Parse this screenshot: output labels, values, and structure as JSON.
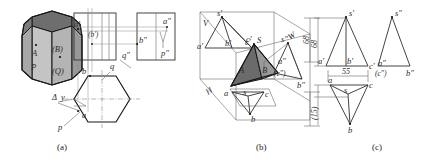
{
  "figure": {
    "captions": [
      {
        "id": "a",
        "text": "(a)"
      },
      {
        "id": "b",
        "text": "(b)"
      },
      {
        "id": "c",
        "text": "(c)"
      }
    ]
  },
  "part_a": {
    "solid_labels": [
      {
        "name": "point-a",
        "text": "A"
      },
      {
        "name": "point-b-hidden",
        "text": "(B)"
      },
      {
        "name": "plane-p",
        "text": "P"
      },
      {
        "name": "plane-q-hidden",
        "text": "(Q)"
      }
    ],
    "front_view_labels": [
      {
        "name": "a-prime",
        "text": "a'"
      },
      {
        "name": "b-prime-hidden",
        "text": "(b')"
      }
    ],
    "side_view_labels": [
      {
        "name": "b-double-prime",
        "text": "b\""
      },
      {
        "name": "a-double-prime",
        "text": "a\""
      },
      {
        "name": "p-double-prime",
        "text": "p\""
      },
      {
        "name": "q-double-prime",
        "text": "q\""
      }
    ],
    "top_view_labels": [
      {
        "name": "b-top",
        "text": "b"
      },
      {
        "name": "q-top",
        "text": "q"
      },
      {
        "name": "a-top",
        "text": "a"
      },
      {
        "name": "p-top",
        "text": "p"
      },
      {
        "name": "delta-y",
        "text": "y"
      },
      {
        "name": "delta-symbol",
        "text": "Δ"
      }
    ]
  },
  "part_b": {
    "plane_labels": [
      {
        "name": "plane-v",
        "text": "V"
      },
      {
        "name": "plane-w",
        "text": "W"
      },
      {
        "name": "plane-h",
        "text": "H"
      }
    ],
    "front_view_labels": [
      {
        "name": "s-prime",
        "text": "s'"
      },
      {
        "name": "a-prime",
        "text": "a'"
      },
      {
        "name": "b-prime",
        "text": "b'"
      },
      {
        "name": "c-prime-front",
        "text": "c'"
      }
    ],
    "solid_labels": [
      {
        "name": "apex-s",
        "text": "S"
      },
      {
        "name": "face-a",
        "text": "A"
      },
      {
        "name": "face-b",
        "text": "B"
      },
      {
        "name": "vertex-c-prime",
        "text": "c'"
      }
    ],
    "side_view_labels": [
      {
        "name": "s-double-prime",
        "text": "s\""
      },
      {
        "name": "a-double-prime",
        "text": "a\""
      },
      {
        "name": "c-double-prime-hidden",
        "text": "(c\")"
      },
      {
        "name": "b-double-prime",
        "text": "b\""
      }
    ],
    "top_view_labels": [
      {
        "name": "s-top",
        "text": "s"
      },
      {
        "name": "a-top",
        "text": "a"
      },
      {
        "name": "b-top",
        "text": "b"
      },
      {
        "name": "c-top",
        "text": "c"
      }
    ],
    "dimensions": [
      {
        "name": "height-dimension",
        "text": "68"
      },
      {
        "name": "depth-dimension",
        "text": "(15)"
      }
    ]
  },
  "part_c": {
    "front_view_labels": [
      {
        "name": "s-prime",
        "text": "s'"
      },
      {
        "name": "a-prime",
        "text": "a'"
      },
      {
        "name": "b-prime",
        "text": "b'"
      },
      {
        "name": "c-prime",
        "text": "c'"
      }
    ],
    "side_view_labels": [
      {
        "name": "s-double-prime",
        "text": "s\""
      },
      {
        "name": "a-double-prime",
        "text": "a\""
      },
      {
        "name": "c-double-prime-hidden",
        "text": "(c\")"
      },
      {
        "name": "b-double-prime",
        "text": "b\""
      }
    ],
    "top_view_labels": [
      {
        "name": "s-top",
        "text": "s"
      },
      {
        "name": "a-top",
        "text": "a"
      },
      {
        "name": "b-top",
        "text": "b"
      },
      {
        "name": "c-top",
        "text": "c"
      }
    ],
    "dimensions": [
      {
        "name": "height-dimension",
        "text": "68"
      },
      {
        "name": "width-dimension",
        "text": "55"
      },
      {
        "name": "depth-dimension",
        "text": "(15)"
      }
    ]
  },
  "colors": {
    "paper": "#ffffff",
    "outline_dark": "#161616",
    "thin_line": "#5d5d5d",
    "prism_face_light": "#c8c8c8",
    "prism_face_mid": "#b0b0b0",
    "prism_top_dark": "#6e6e6e",
    "tetra_face_dark": "#6b6b6b",
    "tetra_face_mid": "#9a9a9a"
  }
}
